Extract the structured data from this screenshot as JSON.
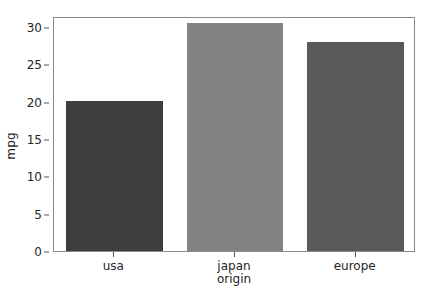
{
  "chart_data": {
    "type": "bar",
    "title": "",
    "subtitle": "",
    "xlabel": "origin",
    "ylabel": "mpg",
    "categories": [
      "usa",
      "japan",
      "europe"
    ],
    "values": [
      20.1,
      30.5,
      28.0
    ],
    "series": [
      {
        "name": "mpg",
        "values": [
          20.1,
          30.5,
          28.0
        ]
      }
    ],
    "bar_colors": [
      "#3d3d3d",
      "#838383",
      "#5a5a5a"
    ],
    "ylim": [
      0,
      31.5
    ],
    "xlim": [
      -0.5,
      2.5
    ],
    "yticks": [
      0,
      5,
      10,
      15,
      20,
      25,
      30
    ],
    "ytick_labels": [
      "0",
      "5",
      "10",
      "15",
      "20",
      "25",
      "30"
    ],
    "xtick_labels": [
      "usa",
      "japan",
      "europe"
    ],
    "grid": false,
    "legend": false,
    "legend_position": "none",
    "frame_color": "#8a8a8a",
    "background_color": "#ffffff",
    "text_color": "#262626",
    "bar_width_fraction": 0.8
  }
}
